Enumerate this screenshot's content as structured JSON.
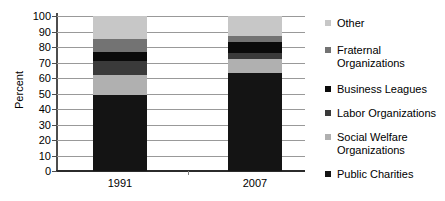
{
  "chart_data": {
    "type": "bar",
    "subtype": "stacked-bar-100",
    "title": "",
    "xlabel": "",
    "ylabel": "Percent",
    "categories": [
      "1991",
      "2007"
    ],
    "ylim": [
      0,
      100
    ],
    "yticks": [
      0,
      10,
      20,
      30,
      40,
      50,
      60,
      70,
      80,
      90,
      100
    ],
    "ytick_labels": [
      "0",
      "10",
      "20",
      "30",
      "40",
      "50",
      "60",
      "70",
      "80",
      "90",
      "100"
    ],
    "grid": true,
    "legend_position": "right",
    "stack_order_bottom_to_top": [
      "Public Charities",
      "Social Welfare Organizations",
      "Labor Organizations",
      "Business Leagues",
      "Fraternal Organizations",
      "Other"
    ],
    "series": [
      {
        "name": "Public Charities",
        "color": "#141414",
        "values": [
          49,
          63
        ]
      },
      {
        "name": "Social Welfare Organizations",
        "color": "#b0b0b0",
        "values": [
          13,
          9
        ]
      },
      {
        "name": "Labor Organizations",
        "color": "#3a3a3a",
        "values": [
          9,
          4
        ]
      },
      {
        "name": "Business Leagues",
        "color": "#0a0a0a",
        "values": [
          6,
          7
        ]
      },
      {
        "name": "Fraternal Organizations",
        "color": "#737373",
        "values": [
          8,
          4
        ]
      },
      {
        "name": "Other",
        "color": "#c7c7c7",
        "values": [
          15,
          13
        ]
      }
    ]
  },
  "legend": {
    "items": [
      {
        "label": "Other",
        "color": "#c7c7c7"
      },
      {
        "label": "Fraternal\nOrganizations",
        "color": "#737373"
      },
      {
        "label": "Business Leagues",
        "color": "#0a0a0a"
      },
      {
        "label": "Labor Organizations",
        "color": "#3a3a3a"
      },
      {
        "label": "Social Welfare\nOrganizations",
        "color": "#b0b0b0"
      },
      {
        "label": "Public Charities",
        "color": "#141414"
      }
    ]
  }
}
